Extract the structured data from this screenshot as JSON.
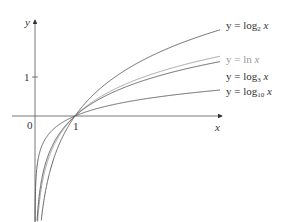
{
  "chart_data": {
    "type": "line",
    "title": "",
    "xlabel": "x",
    "ylabel": "y",
    "origin_label": "0",
    "x_ticks": [
      {
        "value": 1,
        "label": "1"
      }
    ],
    "y_ticks": [
      {
        "value": 1,
        "label": "1"
      }
    ],
    "grid": false,
    "legend_position": "inline-right",
    "series": [
      {
        "name": "y = log₂ x",
        "base": 2,
        "color": "#555555"
      },
      {
        "name": "y = ln x",
        "base": 2.718,
        "color": "#9a9a9a"
      },
      {
        "name": "y = log₃ x",
        "base": 3,
        "color": "#555555"
      },
      {
        "name": "y = log₁₀ x",
        "base": 10,
        "color": "#555555"
      }
    ],
    "xlim": [
      -0.9,
      5.4
    ],
    "ylim": [
      -2.6,
      3
    ]
  },
  "labels": {
    "y_axis": "y",
    "x_axis": "x",
    "origin": "0",
    "x_tick_1": "1",
    "y_tick_1": "1",
    "log2": {
      "prefix": "y = log",
      "sub": "2",
      "var": "x"
    },
    "ln": {
      "prefix": "y = ln ",
      "var": "x"
    },
    "log3": {
      "prefix": "y = log",
      "sub": "3",
      "var": "x"
    },
    "log10": {
      "prefix": "y = log",
      "sub": "10",
      "var": "x"
    }
  }
}
